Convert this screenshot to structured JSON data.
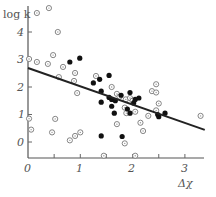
{
  "chart_data": {
    "type": "scatter",
    "title": "",
    "xlabel": "Δχ",
    "ylabel": "log k",
    "xlim": [
      0,
      3.4
    ],
    "ylim": [
      -0.55,
      4.7
    ],
    "x_ticks": [
      0,
      1,
      2,
      3
    ],
    "x_tick_labels": [
      "0",
      "1",
      "2",
      "3"
    ],
    "x_minor_ticks": [
      0.5,
      1.5,
      2.5
    ],
    "y_ticks": [
      0,
      1,
      2,
      3,
      4
    ],
    "y_tick_labels": [
      "0",
      "1",
      "2",
      "3",
      "4"
    ],
    "grid": false,
    "legend": null,
    "series": [
      {
        "name": "open circles",
        "marker": "open-circle",
        "points": [
          [
            0.17,
            4.69
          ],
          [
            0.4,
            4.87
          ],
          [
            0.57,
            4.0
          ],
          [
            0.02,
            3.02
          ],
          [
            0.17,
            2.91
          ],
          [
            0.38,
            2.84
          ],
          [
            0.48,
            3.16
          ],
          [
            0.67,
            2.73
          ],
          [
            0.9,
            2.51
          ],
          [
            0.59,
            2.36
          ],
          [
            0.88,
            2.22
          ],
          [
            0.94,
            1.78
          ],
          [
            0.02,
            0.85
          ],
          [
            0.06,
            0.45
          ],
          [
            0.52,
            0.84
          ],
          [
            0.46,
            0.35
          ],
          [
            0.8,
            0.06
          ],
          [
            0.9,
            0.22
          ],
          [
            1.0,
            0.35
          ],
          [
            1.3,
            2.4
          ],
          [
            1.6,
            2.0
          ],
          [
            1.7,
            1.75
          ],
          [
            1.75,
            1.65
          ],
          [
            1.87,
            1.55
          ],
          [
            1.95,
            1.6
          ],
          [
            2.0,
            1.5
          ],
          [
            1.85,
            1.25
          ],
          [
            1.88,
            1.05
          ],
          [
            2.05,
            1.1
          ],
          [
            1.7,
            0.65
          ],
          [
            1.85,
            -0.05
          ],
          [
            2.45,
            2.1
          ],
          [
            2.37,
            1.85
          ],
          [
            2.45,
            1.8
          ],
          [
            2.5,
            1.4
          ],
          [
            2.45,
            1.15
          ],
          [
            2.3,
            0.95
          ],
          [
            2.15,
            0.7
          ],
          [
            2.2,
            0.4
          ],
          [
            1.45,
            -0.5
          ],
          [
            2.05,
            -0.5
          ],
          [
            3.3,
            0.95
          ]
        ]
      },
      {
        "name": "filled circles",
        "marker": "filled-circle",
        "points": [
          [
            0.8,
            2.91
          ],
          [
            0.99,
            3.05
          ],
          [
            1.37,
            2.28
          ],
          [
            1.55,
            2.42
          ],
          [
            1.25,
            2.15
          ],
          [
            1.4,
            1.85
          ],
          [
            1.55,
            1.62
          ],
          [
            1.6,
            1.55
          ],
          [
            1.67,
            1.5
          ],
          [
            1.4,
            1.45
          ],
          [
            1.78,
            1.7
          ],
          [
            1.95,
            1.8
          ],
          [
            2.02,
            1.42
          ],
          [
            2.05,
            1.55
          ],
          [
            1.9,
            1.2
          ],
          [
            1.95,
            1.05
          ],
          [
            1.65,
            1.05
          ],
          [
            1.8,
            0.2
          ],
          [
            1.4,
            0.22
          ],
          [
            2.48,
            1.0
          ],
          [
            2.5,
            0.92
          ],
          [
            2.62,
            1.05
          ],
          [
            2.12,
            1.6
          ],
          [
            1.6,
            1.3
          ]
        ]
      }
    ],
    "regression_line": {
      "x": [
        0,
        3.38
      ],
      "y": [
        2.69,
        0.44
      ],
      "slope": -0.67,
      "intercept": 2.69
    }
  },
  "labels": {
    "ylabel_text": "log k",
    "xlabel_text": "Δχ",
    "x0": "0",
    "x1": "1",
    "x2": "2",
    "x3": "3",
    "y0": "0",
    "y1": "1",
    "y2": "2",
    "y3": "3",
    "y4": "4"
  }
}
